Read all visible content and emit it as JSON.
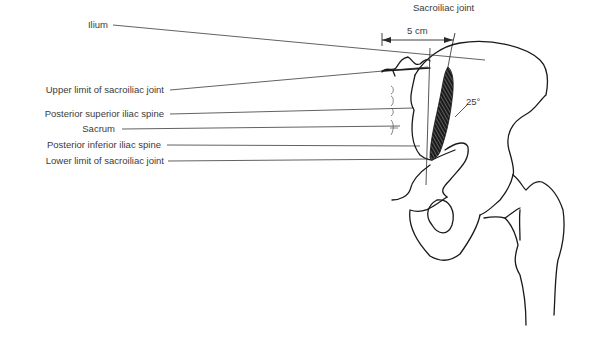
{
  "diagram": {
    "title": "Sacroiliac joint",
    "measurement": "5 cm",
    "angle": "25°",
    "labels": [
      {
        "id": "ilium",
        "text": "Ilium"
      },
      {
        "id": "upper-limit",
        "text": "Upper limit of sacroiliac joint"
      },
      {
        "id": "psis",
        "text": "Posterior superior iliac spine"
      },
      {
        "id": "sacrum",
        "text": "Sacrum"
      },
      {
        "id": "piis",
        "text": "Posterior inferior iliac spine"
      },
      {
        "id": "lower-limit",
        "text": "Lower limit of sacroiliac joint"
      }
    ],
    "colors": {
      "line": "#2a2a2a",
      "text": "#3a3a3a",
      "background": "#ffffff"
    }
  }
}
